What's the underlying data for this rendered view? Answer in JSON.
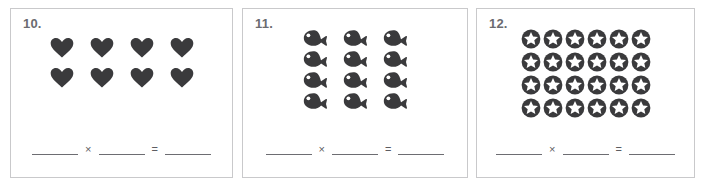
{
  "worksheet": {
    "type": "multiplication-array-worksheet",
    "icon_color": "#3a3a3c",
    "border_color": "#c9c9cb",
    "number_color": "#6b6b70",
    "line_color": "#6d6d72",
    "problems": [
      {
        "number": "10.",
        "icon": "heart-icon",
        "rows": 2,
        "columns": 4,
        "total": 8,
        "answer_line": {
          "factor1": "",
          "operator": "×",
          "factor2": "",
          "equals": "=",
          "product": ""
        }
      },
      {
        "number": "11.",
        "icon": "fish-icon",
        "rows": 4,
        "columns": 3,
        "total": 12,
        "answer_line": {
          "factor1": "",
          "operator": "×",
          "factor2": "",
          "equals": "=",
          "product": ""
        }
      },
      {
        "number": "12.",
        "icon": "star-in-circle-icon",
        "rows": 4,
        "columns": 6,
        "total": 24,
        "answer_line": {
          "factor1": "",
          "operator": "×",
          "factor2": "",
          "equals": "=",
          "product": ""
        }
      }
    ]
  }
}
